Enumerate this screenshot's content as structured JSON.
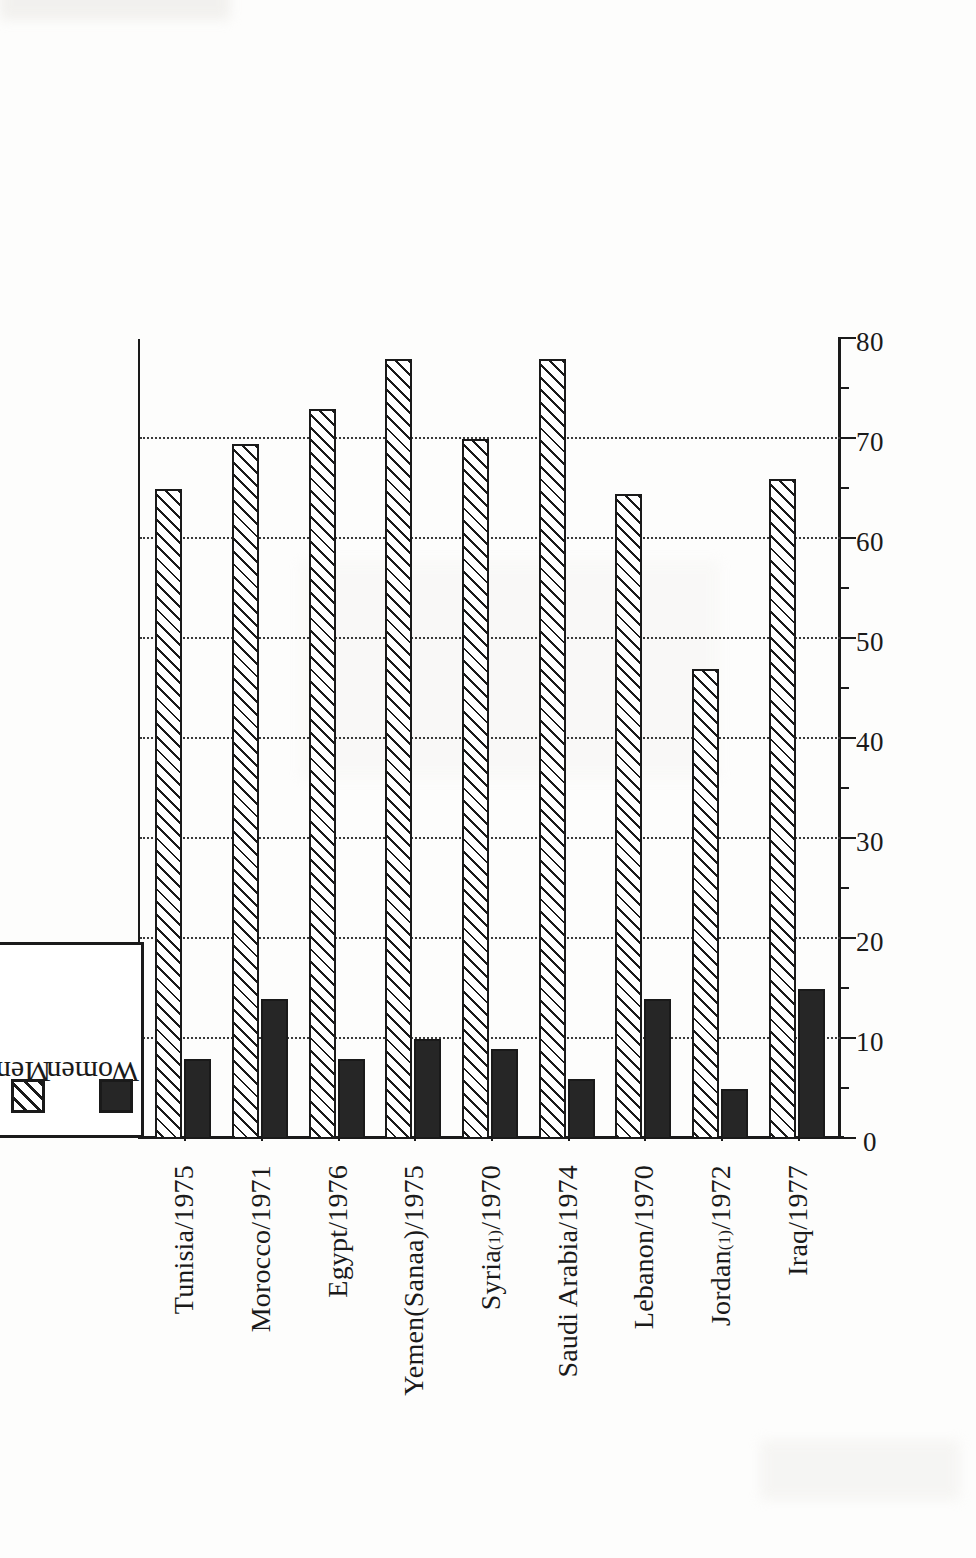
{
  "legend": {
    "entries": [
      {
        "label": "Men",
        "swatch": "hatched-swatch-icon"
      },
      {
        "label": "Women",
        "swatch": "solid-black-swatch-icon"
      }
    ]
  },
  "axis": {
    "value_ticks": [
      "0",
      "10",
      "20",
      "30",
      "40",
      "50",
      "60",
      "70",
      "80"
    ],
    "minor_ticks": [
      "5",
      "15",
      "25",
      "35",
      "45",
      "55",
      "65",
      "75"
    ]
  },
  "chart_data": {
    "type": "bar",
    "title": "",
    "xlabel": "",
    "ylabel": "",
    "ylim": [
      0,
      80
    ],
    "grid": true,
    "legend_position": "top-left",
    "orientation": "rotated-90-ccw",
    "categories": [
      "Tunisia/1975",
      "Morocco/1971",
      "Egypt/1976",
      "Yemen(Sanaa)/1975",
      "Syria(1)/1970",
      "Saudi Arabia/1974",
      "Lebanon/1970",
      "Jordan(1)/1972",
      "Iraq/1977"
    ],
    "series": [
      {
        "name": "Men",
        "values": [
          65,
          69.5,
          73,
          78,
          70,
          78,
          64.5,
          47,
          66
        ]
      },
      {
        "name": "Women",
        "values": [
          8,
          14,
          8,
          10,
          9,
          6,
          14,
          5,
          15
        ]
      }
    ],
    "tick_values": [
      0,
      10,
      20,
      30,
      40,
      50,
      60,
      70,
      80
    ],
    "tick_labels": [
      "0",
      "10",
      "20",
      "30",
      "40",
      "50",
      "60",
      "70",
      "80"
    ],
    "minor_tick_values": [
      5,
      15,
      25,
      35,
      45,
      55,
      65,
      75
    ]
  },
  "colors": {
    "ink": "#1a1a1a",
    "paper": "#fdfdfc",
    "women_fill": "#262626",
    "men_fill": "#ffffff"
  }
}
